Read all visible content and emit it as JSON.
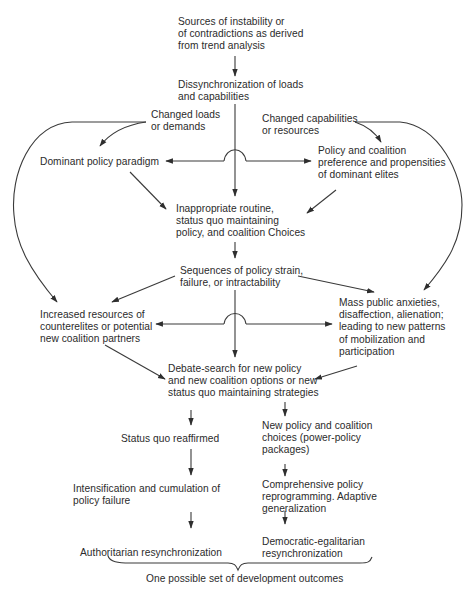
{
  "diagram": {
    "type": "flowchart",
    "nodes": {
      "sources": "Sources of instability or\nof contradictions as derived\nfrom trend analysis",
      "dissync": "Dissynchronization of loads\nand capabilities",
      "changed_loads": "Changed loads\nor demands",
      "changed_capabilities": "Changed capabilities\nor resources",
      "dominant_paradigm": "Dominant policy paradigm",
      "policy_coalition_pref": "Policy and coalition\npreference and propensities\nof dominant elites",
      "inappropriate_routine": "Inappropriate routine,\nstatus quo maintaining\npolicy, and coalition Choices",
      "policy_strain": "Sequences of policy strain,\nfailure, or intractability",
      "increased_resources": "Increased resources of\ncounterelites or potential\nnew coalition partners",
      "mass_public": "Mass public anxieties,\ndisaffection, alienation;\nleading to new patterns\nof mobilization and\nparticipation",
      "debate_search": "Debate-search for new policy\nand new coalition options or new\nstatus quo maintaining strategies",
      "status_quo": "Status quo reaffirmed",
      "new_policy": "New policy and coalition\nchoices (power-policy\npackages)",
      "intensification": "Intensification and cumulation of\npolicy failure",
      "comprehensive": "Comprehensive policy\nreprogramming. Adaptive\ngeneralization",
      "authoritarian": "Authoritarian resynchronization",
      "democratic": "Democratic-egalitarian\nresynchronization",
      "outcomes_label": "One possible set of development outcomes"
    },
    "edges": [
      {
        "from": "sources",
        "to": "dissync"
      },
      {
        "from": "dissync",
        "to": "inappropriate_routine"
      },
      {
        "from": "dissync",
        "to": "dominant_paradigm"
      },
      {
        "from": "dissync",
        "to": "policy_coalition_pref"
      },
      {
        "from": "changed_loads",
        "to": "dominant_paradigm"
      },
      {
        "from": "changed_loads",
        "to": "increased_resources"
      },
      {
        "from": "changed_capabilities",
        "to": "policy_coalition_pref"
      },
      {
        "from": "changed_capabilities",
        "to": "mass_public"
      },
      {
        "from": "dominant_paradigm",
        "to": "inappropriate_routine"
      },
      {
        "from": "policy_coalition_pref",
        "to": "inappropriate_routine"
      },
      {
        "from": "inappropriate_routine",
        "to": "policy_strain"
      },
      {
        "from": "policy_strain",
        "to": "increased_resources"
      },
      {
        "from": "policy_strain",
        "to": "mass_public"
      },
      {
        "from": "policy_strain",
        "to": "debate_search"
      },
      {
        "from": "increased_resources",
        "to": "debate_search"
      },
      {
        "from": "mass_public",
        "to": "debate_search"
      },
      {
        "from": "debate_search",
        "to": "status_quo"
      },
      {
        "from": "debate_search",
        "to": "new_policy"
      },
      {
        "from": "status_quo",
        "to": "intensification"
      },
      {
        "from": "intensification",
        "to": "authoritarian"
      },
      {
        "from": "new_policy",
        "to": "comprehensive"
      },
      {
        "from": "comprehensive",
        "to": "democratic"
      }
    ],
    "colors": {
      "text": "#2b2b2b",
      "lines": "#3a3a3a",
      "background": "#ffffff"
    }
  }
}
